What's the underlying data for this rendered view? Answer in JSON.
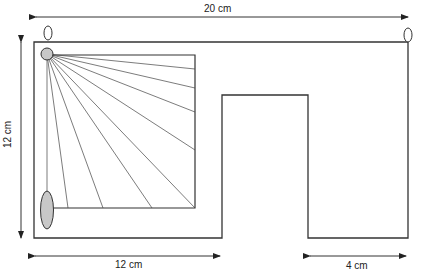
{
  "diagram": {
    "type": "dimensioned-floor-plan",
    "dimensions": {
      "top_width": "20 cm",
      "left_height": "12 cm",
      "bottom_left_width": "12 cm",
      "bottom_right_width": "4 cm"
    },
    "elements": [
      {
        "name": "outer-frame",
        "shape": "polygon"
      },
      {
        "name": "inner-square",
        "shape": "rectangle"
      },
      {
        "name": "light-source",
        "shape": "circle",
        "fill": "#c8c8c8"
      },
      {
        "name": "detector",
        "shape": "ellipse",
        "fill": "#c8c8c8"
      },
      {
        "name": "fan-rays",
        "count": 12
      },
      {
        "name": "hook-left",
        "shape": "ellipse"
      },
      {
        "name": "hook-right",
        "shape": "ellipse"
      }
    ],
    "colors": {
      "stroke": "#333333",
      "fill_gray": "#c8c8c8",
      "background": "#ffffff"
    }
  }
}
